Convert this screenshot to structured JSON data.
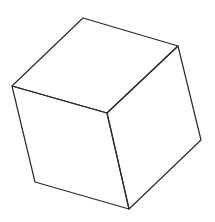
{
  "figure": {
    "stroke_color": "#2a2a2a",
    "background": "#ffffff",
    "stroke_width": 1.2,
    "vertices": {
      "top": [
        83,
        18
      ],
      "right_top": [
        178,
        46
      ],
      "left": [
        12,
        86
      ],
      "center": [
        107,
        113
      ],
      "right_bottom": [
        201,
        140
      ],
      "left_bottom": [
        35,
        182
      ],
      "bottom": [
        129,
        209
      ]
    }
  }
}
